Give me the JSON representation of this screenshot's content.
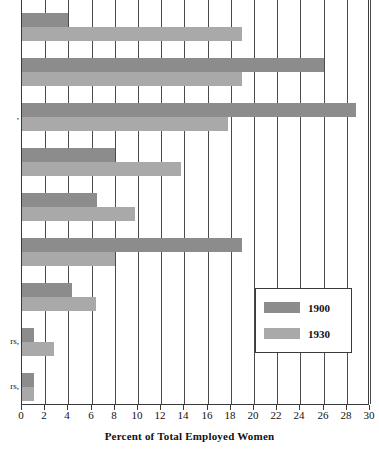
{
  "chart_data": {
    "type": "bar",
    "orientation": "horizontal",
    "title": "",
    "xlabel": "Percent of Total Employed Women",
    "ylabel": "",
    "xlim": [
      0,
      30
    ],
    "xticks": [
      0,
      2,
      4,
      6,
      8,
      10,
      12,
      14,
      16,
      18,
      20,
      22,
      24,
      26,
      28,
      30
    ],
    "grid": true,
    "legend_position": "middle-right",
    "categories": [
      "",
      "",
      ",",
      "",
      "",
      "",
      "",
      "rs,",
      "rs,"
    ],
    "series": [
      {
        "name": "1900",
        "color": "#8c8c8c",
        "values": [
          4.0,
          26.0,
          28.8,
          8.0,
          6.5,
          19.0,
          4.3,
          1.0,
          1.0
        ]
      },
      {
        "name": "1930",
        "color": "#a9a9a9",
        "values": [
          19.0,
          19.0,
          17.8,
          13.7,
          9.7,
          8.0,
          6.4,
          2.8,
          1.0
        ]
      }
    ]
  },
  "axis": {
    "x_title": "Percent of Total Employed Women",
    "tick_labels": [
      "0",
      "2",
      "4",
      "6",
      "8",
      "10",
      "12",
      "14",
      "16",
      "18",
      "20",
      "22",
      "24",
      "26",
      "28",
      "30"
    ]
  },
  "legend": {
    "entries": [
      {
        "label": "1900",
        "color": "#8c8c8c"
      },
      {
        "label": "1930",
        "color": "#a9a9a9"
      }
    ]
  },
  "category_labels": [
    {
      "text": ""
    },
    {
      "text": ""
    },
    {
      "text": ","
    },
    {
      "text": ""
    },
    {
      "text": ""
    },
    {
      "text": ""
    },
    {
      "text": ""
    },
    {
      "text": "rs,"
    },
    {
      "text": "rs,"
    }
  ]
}
